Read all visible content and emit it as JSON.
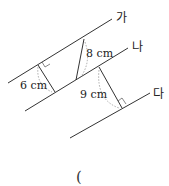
{
  "diagram": {
    "lines": [
      {
        "name": "가",
        "label": "가"
      },
      {
        "name": "나",
        "label": "나"
      },
      {
        "name": "다",
        "label": "다"
      }
    ],
    "measurements": {
      "perp_ga_na": "6 cm",
      "slant_ga_na": "8 cm",
      "perp_na_da": "9 cm"
    },
    "answer_blank": "("
  }
}
